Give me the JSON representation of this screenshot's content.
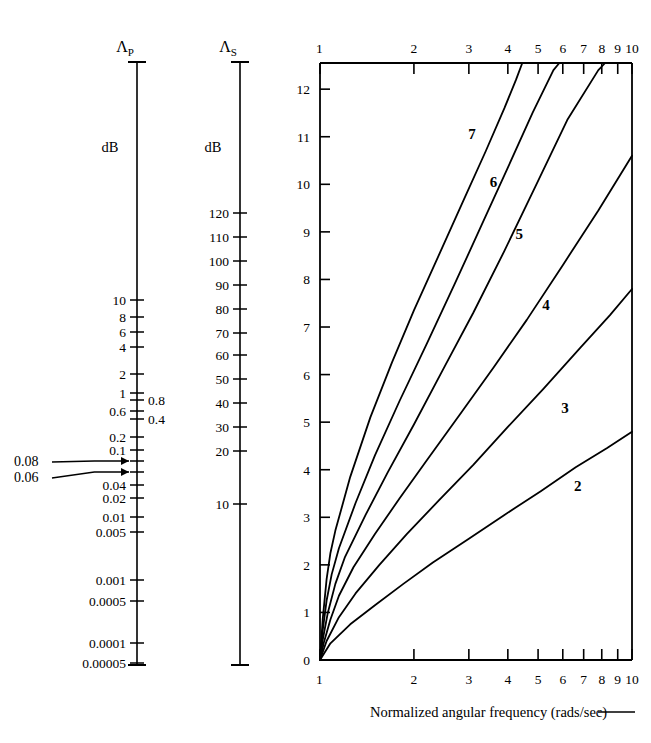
{
  "figure": {
    "caption": "Normalized angular frequency (rads/sec)",
    "caption_dash": "——"
  },
  "passband_scale": {
    "name": "passband-attenuation-scale",
    "head_symbol": "Λ",
    "head_subscript": "P",
    "unit_label": "dB",
    "axis_top_y": 62,
    "axis_bottom_y": 665,
    "ticks": [
      {
        "label": "10",
        "y": 300,
        "long": true
      },
      {
        "label": "8",
        "y": 317,
        "long": true
      },
      {
        "label": "6",
        "y": 332,
        "long": true
      },
      {
        "label": "4",
        "y": 347,
        "long": true
      },
      {
        "label": "2",
        "y": 374,
        "long": true
      },
      {
        "label": "1",
        "y": 393,
        "long": true
      },
      {
        "label": "0.8",
        "y": 400,
        "long": true,
        "side": "right"
      },
      {
        "label": "0.6",
        "y": 411,
        "long": true
      },
      {
        "label": "0.4",
        "y": 419,
        "long": true,
        "side": "right"
      },
      {
        "label": "0.2",
        "y": 437,
        "long": true
      },
      {
        "label": "0.1",
        "y": 450,
        "long": true
      },
      {
        "label": "",
        "y": 461,
        "long": true
      },
      {
        "label": "",
        "y": 472,
        "long": true
      },
      {
        "label": "0.04",
        "y": 485,
        "long": true
      },
      {
        "label": "0.02",
        "y": 498,
        "long": true
      },
      {
        "label": "0.01",
        "y": 517,
        "long": true
      },
      {
        "label": "0.005",
        "y": 532,
        "long": true
      },
      {
        "label": "0.001",
        "y": 580,
        "long": true
      },
      {
        "label": "0.0005",
        "y": 601,
        "long": true
      },
      {
        "label": "0.0001",
        "y": 643,
        "long": true
      },
      {
        "label": "0.00005",
        "y": 663,
        "long": true
      }
    ],
    "annotations": [
      {
        "label": "0.08",
        "label_x": 14,
        "label_y": 466,
        "target_y": 461
      },
      {
        "label": "0.06",
        "label_x": 14,
        "label_y": 482,
        "target_y": 472
      }
    ]
  },
  "stopband_scale": {
    "name": "stopband-attenuation-scale",
    "head_symbol": "Λ",
    "head_subscript": "S",
    "unit_label": "dB",
    "axis_top_y": 62,
    "axis_bottom_y": 665,
    "ticks": [
      {
        "label": "120",
        "y": 213
      },
      {
        "label": "110",
        "y": 237
      },
      {
        "label": "100",
        "y": 261
      },
      {
        "label": "90",
        "y": 285
      },
      {
        "label": "80",
        "y": 309
      },
      {
        "label": "70",
        "y": 333
      },
      {
        "label": "60",
        "y": 355
      },
      {
        "label": "50",
        "y": 379
      },
      {
        "label": "40",
        "y": 403
      },
      {
        "label": "30",
        "y": 427
      },
      {
        "label": "20",
        "y": 451
      },
      {
        "label": "10",
        "y": 504
      }
    ]
  },
  "chart_data": {
    "type": "line",
    "title": "",
    "xlabel": "Normalized angular frequency (rads/sec)",
    "ylabel": "",
    "xscale": "log",
    "yscale": "linear",
    "xlim": [
      1,
      10
    ],
    "ylim": [
      0,
      12.55
    ],
    "grid": false,
    "legend": "inline-curve-labels",
    "x_tick_labels_bottom": [
      "1",
      "2",
      "3",
      "4",
      "5",
      "6",
      "7",
      "8",
      "9",
      "10"
    ],
    "x_tick_labels_top": [
      "1",
      "2",
      "3",
      "4",
      "5",
      "6",
      "7",
      "8",
      "9",
      "10"
    ],
    "x_tick_values": [
      1,
      2,
      3,
      4,
      5,
      6,
      7,
      8,
      9,
      10
    ],
    "y_tick_labels": [
      "0",
      "1",
      "2",
      "3",
      "4",
      "5",
      "6",
      "7",
      "8",
      "9",
      "10",
      "11",
      "12"
    ],
    "y_tick_values": [
      0,
      1,
      2,
      3,
      4,
      5,
      6,
      7,
      8,
      9,
      10,
      11,
      12
    ],
    "series": [
      {
        "name": "7",
        "label": "7",
        "label_x": 3.07,
        "label_y": 10.95,
        "points": [
          [
            1.0,
            0.0
          ],
          [
            1.02,
            0.85
          ],
          [
            1.05,
            1.7
          ],
          [
            1.08,
            2.25
          ],
          [
            1.12,
            2.72
          ],
          [
            1.25,
            3.85
          ],
          [
            1.45,
            5.1
          ],
          [
            1.7,
            6.25
          ],
          [
            2.0,
            7.35
          ],
          [
            2.4,
            8.5
          ],
          [
            2.9,
            9.7
          ],
          [
            3.4,
            10.7
          ],
          [
            3.9,
            11.6
          ],
          [
            4.25,
            12.2
          ],
          [
            4.45,
            12.55
          ]
        ]
      },
      {
        "name": "6",
        "label": "6",
        "label_x": 3.6,
        "label_y": 9.95,
        "points": [
          [
            1.0,
            0.0
          ],
          [
            1.02,
            0.62
          ],
          [
            1.05,
            1.25
          ],
          [
            1.09,
            1.8
          ],
          [
            1.15,
            2.35
          ],
          [
            1.3,
            3.3
          ],
          [
            1.5,
            4.3
          ],
          [
            1.8,
            5.45
          ],
          [
            2.2,
            6.65
          ],
          [
            2.7,
            7.9
          ],
          [
            3.3,
            9.15
          ],
          [
            4.0,
            10.35
          ],
          [
            4.8,
            11.5
          ],
          [
            5.6,
            12.4
          ],
          [
            5.85,
            12.55
          ]
        ]
      },
      {
        "name": "5",
        "label": "5",
        "label_x": 4.35,
        "label_y": 8.85,
        "points": [
          [
            1.0,
            0.0
          ],
          [
            1.02,
            0.42
          ],
          [
            1.06,
            1.0
          ],
          [
            1.12,
            1.6
          ],
          [
            1.2,
            2.15
          ],
          [
            1.4,
            3.05
          ],
          [
            1.65,
            3.95
          ],
          [
            2.0,
            4.95
          ],
          [
            2.5,
            6.15
          ],
          [
            3.1,
            7.3
          ],
          [
            3.9,
            8.6
          ],
          [
            4.9,
            9.95
          ],
          [
            6.2,
            11.35
          ],
          [
            7.8,
            12.4
          ],
          [
            8.2,
            12.55
          ]
        ]
      },
      {
        "name": "4",
        "label": "4",
        "label_x": 5.3,
        "label_y": 7.35,
        "points": [
          [
            1.0,
            0.0
          ],
          [
            1.03,
            0.38
          ],
          [
            1.08,
            0.85
          ],
          [
            1.15,
            1.35
          ],
          [
            1.28,
            1.95
          ],
          [
            1.5,
            2.65
          ],
          [
            1.8,
            3.4
          ],
          [
            2.2,
            4.2
          ],
          [
            2.8,
            5.15
          ],
          [
            3.6,
            6.15
          ],
          [
            4.6,
            7.15
          ],
          [
            6.0,
            8.3
          ],
          [
            7.8,
            9.45
          ],
          [
            10.0,
            10.6
          ]
        ]
      },
      {
        "name": "3",
        "label": "3",
        "label_x": 6.1,
        "label_y": 5.2,
        "points": [
          [
            1.0,
            0.0
          ],
          [
            1.05,
            0.4
          ],
          [
            1.15,
            0.9
          ],
          [
            1.3,
            1.4
          ],
          [
            1.55,
            2.0
          ],
          [
            1.9,
            2.65
          ],
          [
            2.4,
            3.35
          ],
          [
            3.1,
            4.1
          ],
          [
            4.0,
            4.9
          ],
          [
            5.2,
            5.7
          ],
          [
            6.8,
            6.55
          ],
          [
            8.5,
            7.25
          ],
          [
            10.0,
            7.8
          ]
        ]
      },
      {
        "name": "2",
        "label": "2",
        "label_x": 6.7,
        "label_y": 3.55,
        "points": [
          [
            1.0,
            0.0
          ],
          [
            1.08,
            0.35
          ],
          [
            1.25,
            0.75
          ],
          [
            1.5,
            1.15
          ],
          [
            1.85,
            1.6
          ],
          [
            2.3,
            2.05
          ],
          [
            3.0,
            2.55
          ],
          [
            3.9,
            3.05
          ],
          [
            5.1,
            3.55
          ],
          [
            6.6,
            4.05
          ],
          [
            8.3,
            4.45
          ],
          [
            10.0,
            4.8
          ]
        ]
      }
    ]
  }
}
